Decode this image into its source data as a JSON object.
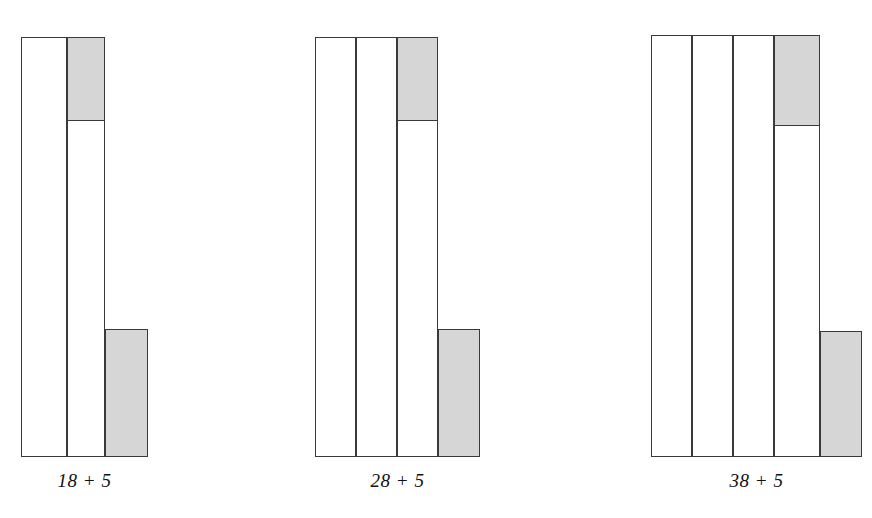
{
  "figure": {
    "title": "",
    "background_color": "#ffffff",
    "outline_color": "#3a3a3a",
    "fill_color": "#d6d6d6",
    "empty_color": "#ffffff"
  },
  "chart_data": {
    "type": "bar",
    "title": "",
    "subtitle": "",
    "xlabel": "",
    "ylabel": "",
    "grid": false,
    "legend": "none",
    "categories": [
      "18 + 5",
      "28 + 5",
      "38 + 5"
    ],
    "groups": [
      {
        "label": "18 + 5",
        "columns": 3,
        "bars": [
          {
            "name": "ten-1",
            "height_units": 10,
            "filled_units": 0
          },
          {
            "name": "ten-2",
            "height_units": 10,
            "filled_units": 2
          },
          {
            "name": "ones",
            "height_units": 3,
            "filled_units": 3
          }
        ]
      },
      {
        "label": "28 + 5",
        "columns": 4,
        "bars": [
          {
            "name": "ten-1",
            "height_units": 10,
            "filled_units": 0
          },
          {
            "name": "ten-2",
            "height_units": 10,
            "filled_units": 0
          },
          {
            "name": "ten-3",
            "height_units": 10,
            "filled_units": 2
          },
          {
            "name": "ones",
            "height_units": 3,
            "filled_units": 3
          }
        ]
      },
      {
        "label": "38 + 5",
        "columns": 5,
        "bars": [
          {
            "name": "ten-1",
            "height_units": 10,
            "filled_units": 0
          },
          {
            "name": "ten-2",
            "height_units": 10,
            "filled_units": 0
          },
          {
            "name": "ten-3",
            "height_units": 10,
            "filled_units": 0
          },
          {
            "name": "ten-4",
            "height_units": 10,
            "filled_units": 2
          },
          {
            "name": "ones",
            "height_units": 3,
            "filled_units": 3
          }
        ]
      }
    ]
  },
  "groups": [
    {
      "id": "group-18-plus-5",
      "label": "18 + 5",
      "label_left": 21,
      "label_width": 127,
      "label_top": 470,
      "bars": [
        {
          "name": "tens-column-1",
          "left": 21,
          "top": 37,
          "width": 46,
          "height": 420,
          "filled_top": 0,
          "filled_height": 0
        },
        {
          "name": "tens-column-2",
          "left": 67,
          "top": 37,
          "width": 38,
          "height": 420,
          "filled_top": 0,
          "filled_height": 84
        },
        {
          "name": "ones-column",
          "left": 105,
          "top": 329,
          "width": 43,
          "height": 128,
          "filled_top": 0,
          "filled_height": 128
        }
      ]
    },
    {
      "id": "group-28-plus-5",
      "label": "28 + 5",
      "label_left": 315,
      "label_width": 165,
      "label_top": 470,
      "bars": [
        {
          "name": "tens-column-1",
          "left": 315,
          "top": 37,
          "width": 41,
          "height": 420,
          "filled_top": 0,
          "filled_height": 0
        },
        {
          "name": "tens-column-2",
          "left": 356,
          "top": 37,
          "width": 41,
          "height": 420,
          "filled_top": 0,
          "filled_height": 0
        },
        {
          "name": "tens-column-3",
          "left": 397,
          "top": 37,
          "width": 41,
          "height": 420,
          "filled_top": 0,
          "filled_height": 84
        },
        {
          "name": "ones-column",
          "left": 438,
          "top": 329,
          "width": 42,
          "height": 128,
          "filled_top": 0,
          "filled_height": 128
        }
      ]
    },
    {
      "id": "group-38-plus-5",
      "label": "38 + 5",
      "label_left": 651,
      "label_width": 211,
      "label_top": 470,
      "bars": [
        {
          "name": "tens-column-1",
          "left": 651,
          "top": 35,
          "width": 41,
          "height": 422,
          "filled_top": 0,
          "filled_height": 0
        },
        {
          "name": "tens-column-2",
          "left": 692,
          "top": 35,
          "width": 41,
          "height": 422,
          "filled_top": 0,
          "filled_height": 0
        },
        {
          "name": "tens-column-3",
          "left": 733,
          "top": 35,
          "width": 41,
          "height": 422,
          "filled_top": 0,
          "filled_height": 0
        },
        {
          "name": "tens-column-4",
          "left": 774,
          "top": 35,
          "width": 46,
          "height": 422,
          "filled_top": 0,
          "filled_height": 91
        },
        {
          "name": "ones-column",
          "left": 820,
          "top": 331,
          "width": 42,
          "height": 126,
          "filled_top": 0,
          "filled_height": 126
        }
      ]
    }
  ]
}
